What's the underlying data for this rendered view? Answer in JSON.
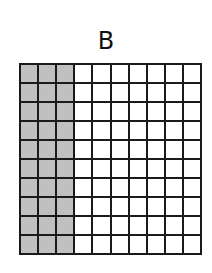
{
  "diagram": {
    "label": "B",
    "grid": {
      "rows": 10,
      "cols": 10,
      "shaded_columns": 3,
      "shaded_count": 30,
      "total_cells": 100
    },
    "colors": {
      "shaded": "#c0c0c0",
      "unshaded": "#ffffff",
      "lines": "#1a1a1a"
    }
  }
}
